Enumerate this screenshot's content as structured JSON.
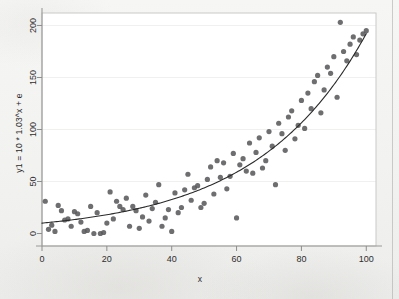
{
  "figure": {
    "background_color": "#f3f3f1",
    "plot_background_color": "#ffffff",
    "frame_color": "#9a9a9a",
    "marker_color": "#5a5a5c",
    "curve_color": "#2a2a2a",
    "grid_color": "#f0f0ee",
    "tick_color": "#8d8d8d",
    "text_color": "#2b2b2b"
  },
  "chart_data": {
    "type": "scatter",
    "title": "",
    "subtitle": "",
    "xlabel": "x",
    "ylabel": "y1 = 10 * 1.03^x + e",
    "xlim": [
      0,
      103
    ],
    "ylim": [
      -12,
      212
    ],
    "xticks": [
      0,
      20,
      40,
      60,
      80,
      100
    ],
    "xticklabels": [
      "0",
      "20",
      "40",
      "60",
      "80",
      "100"
    ],
    "yticks": [
      0,
      50,
      100,
      150,
      200
    ],
    "yticklabels": [
      "0",
      "50",
      "100",
      "150",
      "200"
    ],
    "grid": "horizontal-only-faint",
    "legend": null,
    "legend_position": "none",
    "annotations": [],
    "series": [
      {
        "name": "observed",
        "type": "scatter",
        "marker": "filled-circle",
        "marker_size": 4,
        "color": "#5a5a5c",
        "x": [
          1,
          2,
          3,
          4,
          5,
          6,
          7,
          8,
          9,
          10,
          11,
          12,
          13,
          14,
          15,
          16,
          17,
          18,
          19,
          20,
          21,
          22,
          23,
          24,
          25,
          26,
          27,
          28,
          29,
          30,
          31,
          32,
          33,
          34,
          35,
          36,
          37,
          38,
          39,
          40,
          41,
          42,
          43,
          44,
          45,
          46,
          47,
          48,
          49,
          50,
          51,
          52,
          53,
          54,
          55,
          56,
          57,
          58,
          59,
          60,
          61,
          62,
          63,
          64,
          65,
          66,
          67,
          68,
          69,
          70,
          71,
          72,
          73,
          74,
          75,
          76,
          77,
          78,
          79,
          80,
          81,
          82,
          83,
          84,
          85,
          86,
          87,
          88,
          89,
          90,
          91,
          92,
          93,
          94,
          95,
          96,
          97,
          98,
          99,
          100
        ],
        "y": [
          31,
          4,
          8,
          2,
          27,
          22,
          13,
          14,
          7,
          21,
          19,
          11,
          2,
          3,
          26,
          0,
          20,
          0,
          1,
          10,
          40,
          14,
          31,
          26,
          23,
          34,
          7,
          26,
          22,
          5,
          16,
          37,
          12,
          24,
          30,
          47,
          7,
          15,
          23,
          2,
          39,
          20,
          25,
          42,
          57,
          32,
          44,
          46,
          25,
          29,
          52,
          64,
          38,
          70,
          54,
          68,
          43,
          55,
          77,
          15,
          66,
          72,
          60,
          87,
          58,
          78,
          92,
          63,
          70,
          98,
          84,
          47,
          106,
          96,
          80,
          112,
          118,
          91,
          104,
          128,
          101,
          135,
          120,
          146,
          152,
          116,
          138,
          160,
          154,
          170,
          131,
          203,
          175,
          166,
          182,
          189,
          172,
          186,
          192,
          195
        ]
      },
      {
        "name": "fitted exponential curve",
        "type": "line",
        "color": "#2a2a2a",
        "equation": "y = 10 * 1.03^x",
        "base": 1.03,
        "coefficient": 10,
        "x": [
          0,
          5,
          10,
          15,
          20,
          25,
          30,
          35,
          40,
          45,
          50,
          55,
          60,
          65,
          70,
          75,
          80,
          85,
          90,
          95,
          100
        ],
        "y": [
          10.0,
          11.6,
          13.4,
          15.6,
          18.1,
          20.9,
          24.3,
          28.1,
          32.6,
          37.8,
          43.8,
          50.8,
          58.9,
          68.3,
          79.2,
          91.8,
          106.4,
          123.3,
          143.0,
          165.8,
          192.2
        ]
      }
    ]
  }
}
